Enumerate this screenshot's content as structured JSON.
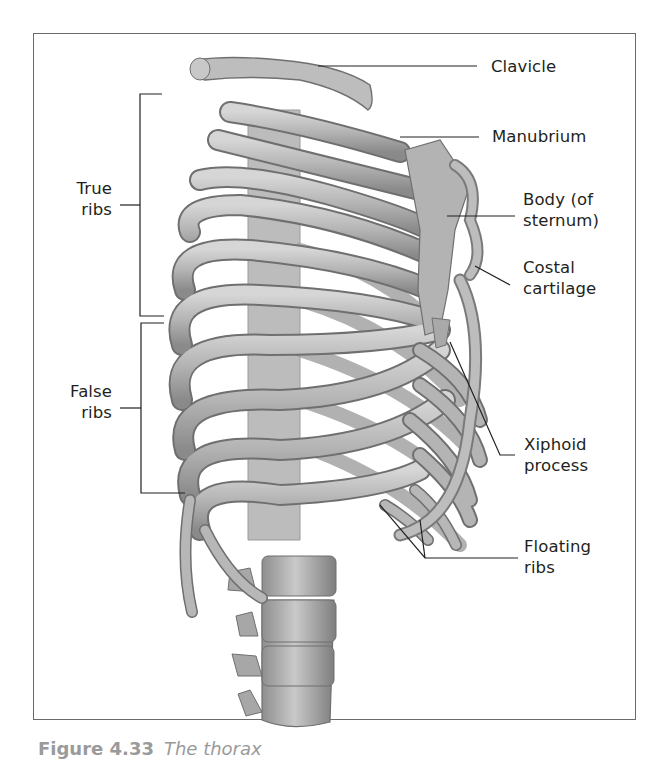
{
  "figure": {
    "caption_number": "Figure 4.33",
    "caption_text": "The thorax"
  },
  "labels": {
    "clavicle": "Clavicle",
    "manubrium": "Manubrium",
    "body_of_sternum_line1": "Body (of",
    "body_of_sternum_line2": "sternum)",
    "costal_cartilage_line1": "Costal",
    "costal_cartilage_line2": "cartilage",
    "xiphoid_line1": "Xiphoid",
    "xiphoid_line2": "process",
    "floating_line1": "Floating",
    "floating_line2": "ribs",
    "true_ribs_line1": "True",
    "true_ribs_line2": "ribs",
    "false_ribs_line1": "False",
    "false_ribs_line2": "ribs"
  },
  "colors": {
    "bone": "#b9b9b9",
    "bone_dark": "#7d7d7d",
    "bone_light": "#dcdcdc",
    "line": "#231f20",
    "frame": "#6a6a6a"
  }
}
